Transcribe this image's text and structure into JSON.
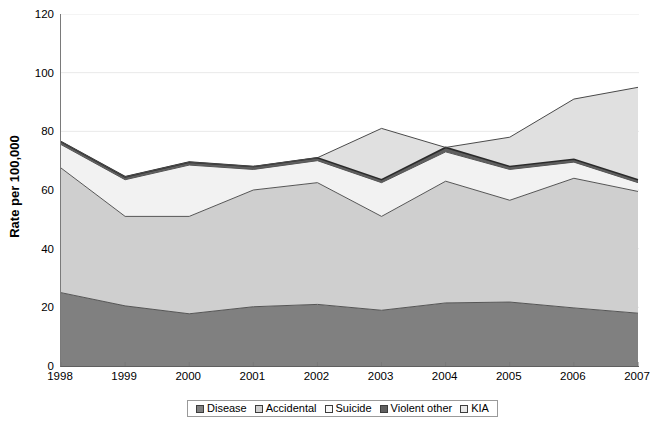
{
  "chart_data": {
    "type": "area",
    "stacked": true,
    "title": "",
    "xlabel": "",
    "ylabel": "Rate per 100,000",
    "categories": [
      "1998",
      "1999",
      "2000",
      "2001",
      "2002",
      "2003",
      "2004",
      "2005",
      "2006",
      "2007"
    ],
    "x": [
      1998,
      1999,
      2000,
      2001,
      2002,
      2003,
      2004,
      2005,
      2006,
      2007
    ],
    "ylim": [
      0,
      120
    ],
    "yticks": [
      0,
      20,
      40,
      60,
      80,
      100,
      120
    ],
    "ytick_labels": [
      "0",
      "20",
      "40",
      "60",
      "80",
      "100",
      "120"
    ],
    "grid": true,
    "grid_axis": "y",
    "legend_position": "bottom",
    "series": [
      {
        "name": "Disease",
        "color": "#808080",
        "values": [
          25.0,
          20.5,
          17.8,
          20.2,
          21.0,
          19.0,
          21.5,
          21.8,
          19.8,
          18.0
        ]
      },
      {
        "name": "Accidental",
        "color": "#cfcfcf",
        "values": [
          42.5,
          30.5,
          33.2,
          39.8,
          41.5,
          32.0,
          41.5,
          34.7,
          44.2,
          41.5
        ]
      },
      {
        "name": "Suicide",
        "color": "#f2f2f2",
        "values": [
          8.0,
          12.5,
          17.5,
          7.0,
          7.5,
          11.5,
          10.0,
          10.5,
          5.5,
          3.0
        ]
      },
      {
        "name": "Violent other",
        "color": "#606060",
        "values": [
          1.0,
          1.0,
          1.0,
          1.0,
          1.0,
          1.0,
          1.5,
          1.0,
          1.0,
          1.0
        ]
      },
      {
        "name": "KIA",
        "color": "#e0e0e0",
        "values": [
          0.0,
          0.0,
          0.0,
          0.0,
          0.0,
          17.5,
          0.0,
          10.0,
          20.5,
          31.5
        ]
      }
    ],
    "totals": [
      76.5,
      64.5,
      69.5,
      68.0,
      71.0,
      81.0,
      74.5,
      78.0,
      91.0,
      95.0
    ]
  },
  "legend": {
    "items": [
      {
        "label": "Disease",
        "swatch": "#808080"
      },
      {
        "label": "Accidental",
        "swatch": "#cfcfcf"
      },
      {
        "label": "Suicide",
        "swatch": "#f7f7f7"
      },
      {
        "label": "Violent other",
        "swatch": "#606060"
      },
      {
        "label": "KIA",
        "swatch": "#e8e8e8"
      }
    ]
  }
}
